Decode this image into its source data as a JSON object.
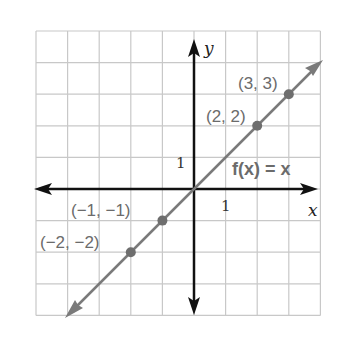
{
  "chart_data": {
    "type": "line",
    "title": "",
    "function_label": "f(x) = x",
    "xlabel": "x",
    "ylabel": "y",
    "xlim": [
      -5,
      4
    ],
    "ylim": [
      -4,
      5
    ],
    "grid": true,
    "tick_labels": {
      "x": "1",
      "y": "1"
    },
    "series": [
      {
        "name": "f(x) = x",
        "x": [
          -4,
          4
        ],
        "y": [
          -4,
          4
        ],
        "color": "#7a7a7a"
      }
    ],
    "points": [
      {
        "x": -2,
        "y": -2,
        "label": "(−2, −2)"
      },
      {
        "x": -1,
        "y": -1,
        "label": "(−1, −1)"
      },
      {
        "x": 2,
        "y": 2,
        "label": "(2, 2)"
      },
      {
        "x": 3,
        "y": 3,
        "label": "(3, 3)"
      }
    ]
  },
  "colors": {
    "grid": "#c8c8c8",
    "axis": "#111111",
    "line": "#7a7a7a",
    "point": "#6e6e6e",
    "label": "#6b6b6b"
  }
}
